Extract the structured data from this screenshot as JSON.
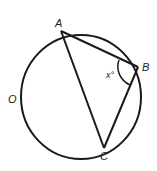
{
  "diagram": {
    "type": "circle-inscribed-triangle",
    "circle": {
      "label": "O",
      "cx": 81,
      "cy": 97,
      "rx": 60,
      "ry": 62
    },
    "points": {
      "A": {
        "label": "A",
        "x": 61,
        "y": 31
      },
      "B": {
        "label": "B",
        "x": 138,
        "y": 67
      },
      "C": {
        "label": "C",
        "x": 104,
        "y": 148
      }
    },
    "angle": {
      "vertex": "B",
      "label": "x°"
    },
    "stroke_color": "#1a1a1a"
  }
}
